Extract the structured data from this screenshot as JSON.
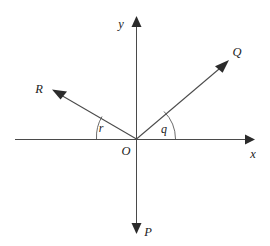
{
  "figure": {
    "background_color": "#ffffff",
    "line_color": "#4a4a4a",
    "arrow_color": "#2b2b2b",
    "label_color": "#222222",
    "width": 270,
    "height": 246
  },
  "axes": {
    "origin": {
      "label": "O",
      "x": 136,
      "y": 139
    },
    "x_axis": {
      "label": "x",
      "label_x": 253,
      "label_y": 155,
      "start_x": 15,
      "end_x": 253,
      "y": 139,
      "arrow": "right"
    },
    "y_axis": {
      "label": "y",
      "label_x": 126,
      "label_y": 24,
      "x": 136,
      "top_y": 18,
      "bottom_y": 232,
      "arrow_top": "up",
      "arrow_bottom": "down"
    }
  },
  "vectors": [
    {
      "name": "Q",
      "label": "Q",
      "label_x": 236,
      "label_y": 56,
      "tip_x": 227,
      "tip_y": 62,
      "direction_deg": 45,
      "quadrant": "upper-right"
    },
    {
      "name": "R",
      "label": "R",
      "label_x": 38,
      "label_y": 92,
      "tip_x": 54,
      "tip_y": 91,
      "direction_deg": 150,
      "quadrant": "upper-left"
    },
    {
      "name": "P",
      "label": "P",
      "label_x": 145,
      "label_y": 235,
      "tip_x": 136,
      "tip_y": 232,
      "direction_deg": 270,
      "quadrant": "downward along negative y-axis"
    }
  ],
  "angles": [
    {
      "name": "q",
      "label": "q",
      "label_x": 163,
      "label_y": 132,
      "between": "positive x-axis and vector Q",
      "arc_radius": 38
    },
    {
      "name": "r",
      "label": "r",
      "label_x": 100,
      "label_y": 131,
      "between": "negative x-axis and vector R",
      "arc_radius": 40
    }
  ]
}
